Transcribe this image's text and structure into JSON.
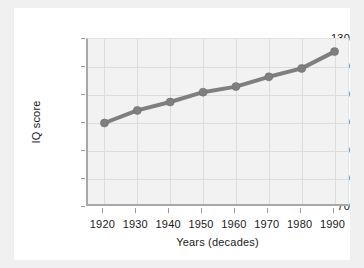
{
  "chart_data": {
    "type": "line",
    "title": "",
    "subtitle": "",
    "xlabel": "Years (decades)",
    "ylabel": "IQ score",
    "x": [
      1920,
      1930,
      1940,
      1950,
      1960,
      1970,
      1980,
      1990
    ],
    "xtick_labels": [
      "1920",
      "1930",
      "1940",
      "1950",
      "1960",
      "1970",
      "1980",
      "1990"
    ],
    "ytick_labels": [
      "130",
      "120",
      "110",
      "100",
      "90",
      "80",
      "70"
    ],
    "yticks": [
      130,
      120,
      110,
      100,
      90,
      80,
      70
    ],
    "xlim": [
      1915,
      1995
    ],
    "ylim": [
      70,
      130
    ],
    "grid": true,
    "legend": "none",
    "series": [
      {
        "name": "IQ score",
        "values": [
          100,
          104.5,
          107.5,
          111,
          113,
          116.5,
          119.5,
          125.5
        ],
        "color": "#7f7f7f",
        "marker": "circle",
        "line_width": 4
      }
    ],
    "annotations": []
  },
  "style": {
    "page_background": "#f0f0f0",
    "card_background": "#ffffff",
    "plot_background": "#f2f2f2",
    "grid_color": "#dcdcdc",
    "axis_color": "#a8a8a8",
    "text_color": "#1a1a1a",
    "series_color": "#7f7f7f"
  }
}
